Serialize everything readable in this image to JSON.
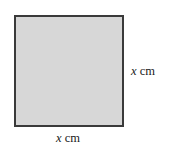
{
  "figure": {
    "name": "square-with-side-x-cm",
    "background_color": "#ffffff",
    "shape": {
      "type": "square",
      "fill_color": "#d7d7d7",
      "stroke_color": "#3a3a3a"
    },
    "labels": {
      "right": {
        "variable": "x",
        "unit": "cm",
        "full_text": "x cm"
      },
      "bottom": {
        "variable": "x",
        "unit": "cm",
        "full_text": "x cm"
      }
    }
  }
}
